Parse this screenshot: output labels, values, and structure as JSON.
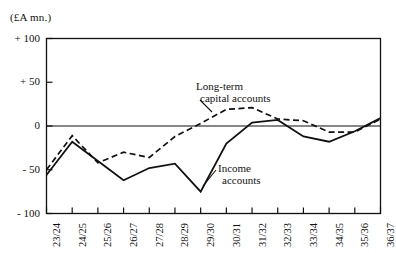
{
  "figure": {
    "unit_label": "(£A mn.)",
    "background_color": "#ffffff",
    "line_color": "#111111"
  },
  "chart_data": {
    "type": "line",
    "title": "",
    "subtitle": "",
    "xlabel": "",
    "ylabel": "(£A mn.)",
    "ylim": [
      -100,
      100
    ],
    "yticks": [
      100,
      50,
      0,
      -50,
      -100
    ],
    "ytick_labels": [
      "+ 100",
      "+ 50",
      "0",
      "- 50",
      "- 100"
    ],
    "grid": false,
    "zero_line": true,
    "legend_position": "inline-annotations",
    "categories": [
      "23/24",
      "24/25",
      "25/26",
      "26/27",
      "27/28",
      "28/29",
      "29/30",
      "30/31",
      "31/32",
      "32/33",
      "33/34",
      "34/35",
      "35/36",
      "36/37"
    ],
    "series": [
      {
        "name": "Income accounts",
        "style": "solid",
        "values": [
          -56,
          -18,
          -40,
          -62,
          -48,
          -43,
          -75,
          -20,
          4,
          7,
          -12,
          -18,
          -6,
          9
        ]
      },
      {
        "name": "Long-term capital accounts",
        "style": "dashed",
        "values": [
          -50,
          -11,
          -42,
          -30,
          -36,
          -12,
          3,
          19,
          21,
          8,
          6,
          -7,
          -7,
          8
        ]
      }
    ],
    "annotations": [
      {
        "name": "long-term-capital-accounts-label",
        "text_lines": [
          "Long-term",
          "capital accounts"
        ],
        "x_category": "28/29",
        "y_value": 42
      },
      {
        "name": "income-accounts-label",
        "text_lines": [
          "Income",
          "accounts"
        ],
        "x_category": "30/31",
        "y_value": -48
      }
    ]
  }
}
